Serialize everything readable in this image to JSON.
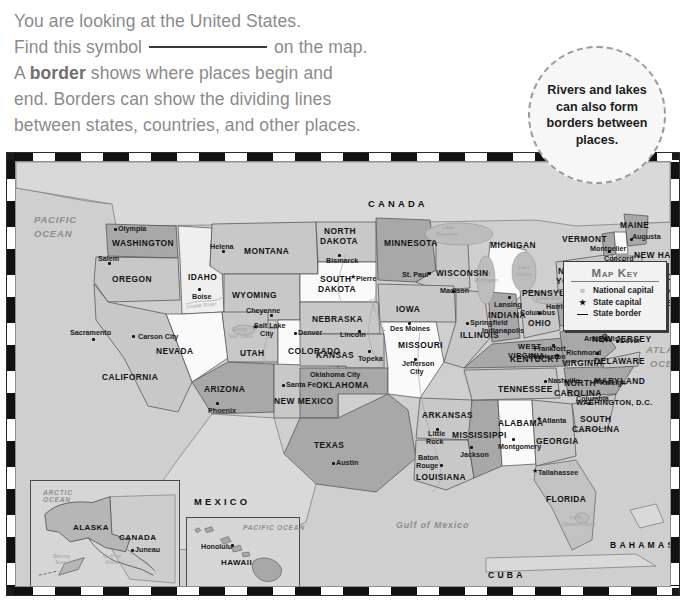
{
  "intro": {
    "line1": "You are looking at the United States.",
    "line2_pre": "Find this symbol",
    "line2_post": "on the map.",
    "line3_pre": "A",
    "line3_bold": "border",
    "line3_post": "shows where places begin and",
    "line4": "end. Borders can show the dividing lines",
    "line5": "between states, countries, and other places."
  },
  "callout": {
    "text": "Rivers and lakes can also form borders between places."
  },
  "map_key": {
    "title": "Map Key",
    "entries": [
      {
        "glyph": "circle",
        "label": "National capital"
      },
      {
        "glyph": "star",
        "label": "State capital"
      },
      {
        "glyph": "line",
        "label": "State border"
      }
    ]
  },
  "compass": {
    "n": "N",
    "e": "E",
    "s": "S",
    "w": "W"
  },
  "countries": [
    "CANADA",
    "MEXICO",
    "CUBA",
    "BAHAMAS"
  ],
  "oceans": [
    "PACIFIC OCEAN",
    "ATLANTIC OCEAN",
    "Gulf of Mexico",
    "ARCTIC OCEAN",
    "PACIFIC OCEAN"
  ],
  "waters": [
    "Lake Superior",
    "Lake Michigan",
    "Lake Huron",
    "Lake Erie",
    "Lake Ontario",
    "Great Salt Lake",
    "Lake Okeechobee",
    "Bering Sea",
    "Gulf of Alaska",
    "Columbia River",
    "Snake River",
    "Missouri River",
    "Mississippi River"
  ],
  "federal_district": "WASHINGTON, D.C.",
  "states": [
    {
      "name": "WASHINGTON",
      "capital": "Olympia"
    },
    {
      "name": "OREGON",
      "capital": "Salem"
    },
    {
      "name": "IDAHO",
      "capital": "Boise"
    },
    {
      "name": "MONTANA",
      "capital": "Helena"
    },
    {
      "name": "WYOMING",
      "capital": "Cheyenne"
    },
    {
      "name": "NEVADA",
      "capital": "Carson City"
    },
    {
      "name": "CALIFORNIA",
      "capital": "Sacramento"
    },
    {
      "name": "UTAH",
      "capital": "Salt Lake City"
    },
    {
      "name": "COLORADO",
      "capital": "Denver"
    },
    {
      "name": "ARIZONA",
      "capital": "Phoenix"
    },
    {
      "name": "NEW MEXICO",
      "capital": "Santa Fe"
    },
    {
      "name": "NORTH DAKOTA",
      "capital": "Bismarck"
    },
    {
      "name": "SOUTH DAKOTA",
      "capital": "Pierre"
    },
    {
      "name": "NEBRASKA",
      "capital": "Lincoln"
    },
    {
      "name": "KANSAS",
      "capital": "Topeka"
    },
    {
      "name": "OKLAHOMA",
      "capital": "Oklahoma City"
    },
    {
      "name": "TEXAS",
      "capital": "Austin"
    },
    {
      "name": "MINNESOTA",
      "capital": "St. Paul"
    },
    {
      "name": "IOWA",
      "capital": "Des Moines"
    },
    {
      "name": "MISSOURI",
      "capital": "Jefferson City"
    },
    {
      "name": "ARKANSAS",
      "capital": "Little Rock"
    },
    {
      "name": "LOUISIANA",
      "capital": "Baton Rouge"
    },
    {
      "name": "WISCONSIN",
      "capital": "Madison"
    },
    {
      "name": "ILLINOIS",
      "capital": "Springfield"
    },
    {
      "name": "MICHIGAN",
      "capital": "Lansing"
    },
    {
      "name": "INDIANA",
      "capital": "Indianapolis"
    },
    {
      "name": "OHIO",
      "capital": "Columbus"
    },
    {
      "name": "KENTUCKY",
      "capital": "Frankfort"
    },
    {
      "name": "TENNESSEE",
      "capital": "Nashville"
    },
    {
      "name": "MISSISSIPPI",
      "capital": "Jackson"
    },
    {
      "name": "ALABAMA",
      "capital": "Montgomery"
    },
    {
      "name": "GEORGIA",
      "capital": "Atlanta"
    },
    {
      "name": "FLORIDA",
      "capital": "Tallahassee"
    },
    {
      "name": "SOUTH CAROLINA",
      "capital": "Columbia"
    },
    {
      "name": "NORTH CAROLINA",
      "capital": "Raleigh"
    },
    {
      "name": "VIRGINIA",
      "capital": "Richmond"
    },
    {
      "name": "WEST VIRGINIA",
      "capital": "Charleston"
    },
    {
      "name": "PENNSYLVANIA",
      "capital": "Harrisburg"
    },
    {
      "name": "NEW YORK",
      "capital": "Albany"
    },
    {
      "name": "VERMONT",
      "capital": "Montpelier"
    },
    {
      "name": "NEW HAMPSHIRE",
      "capital": "Concord"
    },
    {
      "name": "MAINE",
      "capital": "Augusta"
    },
    {
      "name": "MASSACHUSETTS",
      "capital": "Boston"
    },
    {
      "name": "RHODE ISLAND",
      "capital": "Providence"
    },
    {
      "name": "CONNECTICUT",
      "capital": "Hartford"
    },
    {
      "name": "NEW JERSEY",
      "capital": "Trenton"
    },
    {
      "name": "DELAWARE",
      "capital": "Dover"
    },
    {
      "name": "MARYLAND",
      "capital": "Annapolis"
    },
    {
      "name": "ALASKA",
      "capital": "Juneau"
    },
    {
      "name": "HAWAII",
      "capital": "Honolulu"
    }
  ],
  "insets": [
    {
      "name": "ALASKA",
      "neighbor": "CANADA"
    },
    {
      "name": "HAWAII",
      "ocean": "PACIFIC OCEAN"
    }
  ],
  "labels": {
    "st_washington": "WASHINGTON",
    "cap_olympia": "Olympia",
    "st_oregon": "OREGON",
    "cap_salem": "Salem",
    "st_idaho": "IDAHO",
    "cap_boise": "Boise",
    "st_montana": "MONTANA",
    "cap_helena": "Helena",
    "st_wyoming": "WYOMING",
    "cap_cheyenne": "Cheyenne",
    "st_nevada": "NEVADA",
    "cap_carsoncity": "Carson City",
    "st_california": "CALIFORNIA",
    "cap_sacramento": "Sacramento",
    "st_utah": "UTAH",
    "cap_saltlake1": "Salt Lake",
    "cap_saltlake2": "City",
    "st_colorado": "COLORADO",
    "cap_denver": "Denver",
    "st_arizona": "ARIZONA",
    "cap_phoenix": "Phoenix",
    "st_newmexico": "NEW MEXICO",
    "cap_santafe": "Santa Fe",
    "st_northdakota1": "NORTH",
    "st_northdakota2": "DAKOTA",
    "cap_bismarck": "Bismarck",
    "st_southdakota1": "SOUTH",
    "st_southdakota2": "DAKOTA",
    "cap_pierre": "Pierre",
    "st_nebraska": "NEBRASKA",
    "cap_lincoln": "Lincoln",
    "st_kansas": "KANSAS",
    "cap_topeka": "Topeka",
    "st_oklahoma": "OKLAHOMA",
    "cap_oklahomacity": "Oklahoma City",
    "st_texas": "TEXAS",
    "cap_austin": "Austin",
    "st_minnesota": "MINNESOTA",
    "cap_stpaul": "St. Paul",
    "st_iowa": "IOWA",
    "cap_desmoines": "Des Moines",
    "st_missouri": "MISSOURI",
    "cap_jeffcity1": "Jefferson",
    "cap_jeffcity2": "City",
    "st_arkansas": "ARKANSAS",
    "cap_littlerock1": "Little",
    "cap_littlerock2": "Rock",
    "st_louisiana": "LOUISIANA",
    "cap_batonrouge1": "Baton",
    "cap_batonrouge2": "Rouge",
    "st_wisconsin": "WISCONSIN",
    "cap_madison": "Madison",
    "st_illinois": "ILLINOIS",
    "cap_springfield": "Springfield",
    "st_michigan": "MICHIGAN",
    "cap_lansing": "Lansing",
    "st_indiana": "INDIANA",
    "cap_indianapolis": "Indianapolis",
    "st_ohio": "OHIO",
    "cap_columbus": "Columbus",
    "st_kentucky": "KENTUCKY",
    "cap_frankfort": "Frankfort",
    "st_tennessee": "TENNESSEE",
    "cap_nashville": "Nashville",
    "st_mississippi": "MISSISSIPPI",
    "cap_jackson": "Jackson",
    "st_alabama": "ALABAMA",
    "cap_montgomery": "Montgomery",
    "st_georgia": "GEORGIA",
    "cap_atlanta": "Atlanta",
    "st_florida": "FLORIDA",
    "cap_tallahassee": "Tallahassee",
    "st_southcarolina1": "SOUTH",
    "st_southcarolina2": "CAROLINA",
    "cap_columbia_sc": "Columbia",
    "st_northcarolina1": "NORTH",
    "st_northcarolina2": "CAROLINA",
    "cap_raleigh": "Raleigh",
    "st_virginia": "VIRGINIA",
    "cap_richmond": "Richmond",
    "st_westvirginia1": "WEST",
    "st_westvirginia2": "VIRGINIA",
    "cap_charleston": "Charleston",
    "st_pennsylvania": "PENNSYLVANIA",
    "cap_harrisburg": "Harrisburg",
    "st_newyork1": "NEW",
    "st_newyork2": "YORK",
    "cap_albany": "Albany",
    "st_vermont": "VERMONT",
    "cap_montpelier": "Montpelier",
    "st_newhampshire": "NEW HAMPSHIRE",
    "cap_concord": "Concord",
    "st_maine": "MAINE",
    "cap_augusta": "Augusta",
    "st_massachusetts": "MASSACHUSETTS",
    "cap_boston": "Boston",
    "st_rhodeisland": "RHODE ISLAND",
    "cap_providence": "Providence",
    "st_connecticut": "CONNECTICUT",
    "cap_hartford": "Hartford",
    "st_newjersey": "NEW JERSEY",
    "cap_trenton": "Trenton",
    "st_delaware": "DELAWARE",
    "cap_dover": "Dover",
    "st_maryland": "MARYLAND",
    "cap_annapolis": "Annapolis",
    "dc": "WASHINGTON, D.C.",
    "c_canada": "CANADA",
    "c_mexico": "MEXICO",
    "c_cuba": "CUBA",
    "c_bahamas": "BAHAMAS",
    "o_pacific1": "PACIFIC",
    "o_pacific2": "OCEAN",
    "o_atlantic1": "ATLAN",
    "o_atlantic2": "OCE",
    "o_gulf": "Gulf of  Mexico",
    "w_lakesuperior1": "Lake",
    "w_lakesuperior2": "Superior",
    "w_lakemichigan1": "Lake",
    "w_lakemichigan2": "Michigan",
    "w_lakehuron1": "Lake",
    "w_lakehuron2": "Huron",
    "w_lakeerie": "Lake Erie",
    "w_lakeontario": "Lake Ontario",
    "w_greatsalt1": "Great",
    "w_greatsalt2": "Salt Lake",
    "w_okeechobee1": "Lake",
    "w_okeechobee2": "Okeechobee",
    "w_columbia": "Columbia River",
    "w_snake": "Snake River",
    "w_missouri": "Missouri River",
    "i_arctic1": "ARCTIC",
    "i_arctic2": "OCEAN",
    "i_alaska": "ALASKA",
    "i_canada": "CANADA",
    "i_juneau": "Juneau",
    "i_bering1": "Bering",
    "i_bering2": "Sea",
    "i_gulfak1": "Gulf of",
    "i_gulfak2": "Alaska",
    "i_hawaii": "HAWAII",
    "i_honolulu": "Honolulu",
    "i_pacific": "PACIFIC OCEAN"
  }
}
